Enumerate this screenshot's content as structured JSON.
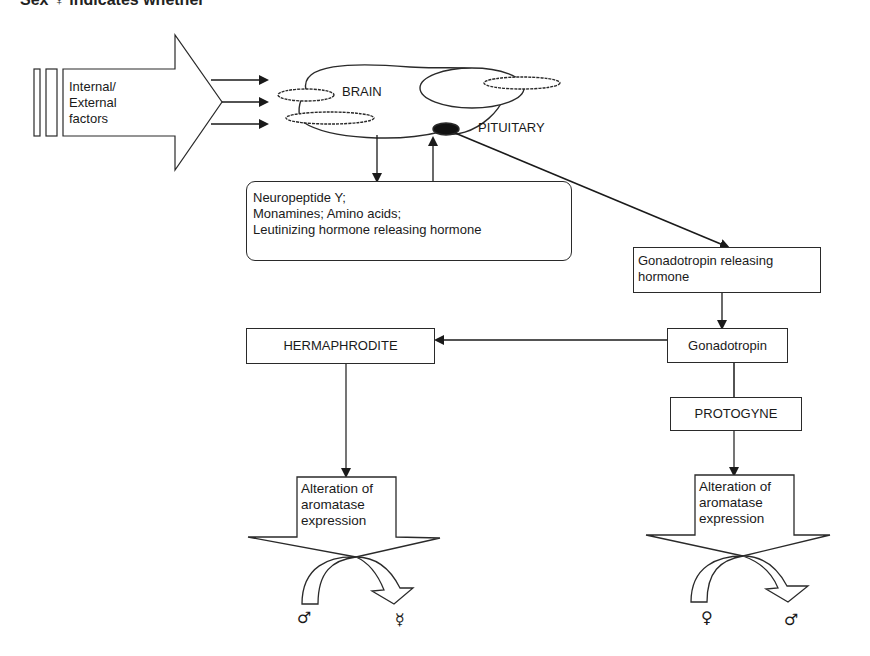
{
  "caption": "Sex ♀ indicates whether",
  "input_arrow": {
    "label_lines": [
      "Internal/",
      "External",
      "factors"
    ]
  },
  "brain": {
    "brain_label": "BRAIN",
    "pituitary_label": "PITUITARY"
  },
  "neuro_box": {
    "lines": [
      "Neuropeptide Y;",
      "Monamines; Amino acids;",
      "Leutinizing hormone releasing hormone"
    ]
  },
  "gnrh_box": {
    "lines": [
      "Gonadotropin releasing",
      "hormone"
    ]
  },
  "gonadotropin_box": {
    "label": "Gonadotropin"
  },
  "hermaphrodite_box": {
    "label": "HERMAPHRODITE"
  },
  "protogyne_box": {
    "label": "PROTOGYNE"
  },
  "left_outcome": {
    "lines": [
      "Alteration of",
      "aromatase",
      "expression"
    ],
    "from_symbol": "♂",
    "to_symbol": "☿"
  },
  "right_outcome": {
    "lines": [
      "Alteration of",
      "aromatase",
      "expression"
    ],
    "from_symbol": "♀",
    "to_symbol": "♂"
  }
}
